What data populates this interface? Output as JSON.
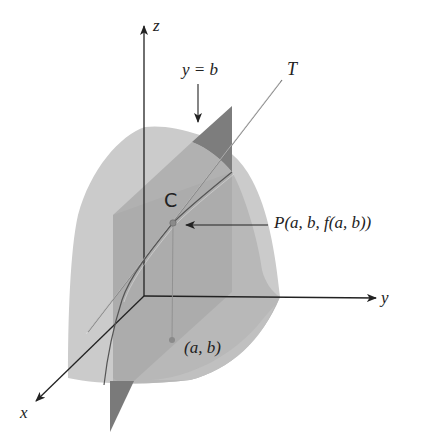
{
  "figure": {
    "type": "3d-surface-diagram",
    "labels": {
      "z_axis": "z",
      "y_axis": "y",
      "x_axis": "x",
      "plane": "y = b",
      "tangent": "T",
      "curve": "C",
      "point": "P(a, b, f(a, b))",
      "base_point": "(a, b)"
    },
    "colors": {
      "surface_light": "#c9c9c9",
      "surface_mid": "#b4b4b4",
      "plane_dark": "#7a7a7a",
      "plane_mid": "#a2a2a2",
      "axis": "#222222",
      "curve": "#555555",
      "point": "#8a8a8a"
    }
  }
}
